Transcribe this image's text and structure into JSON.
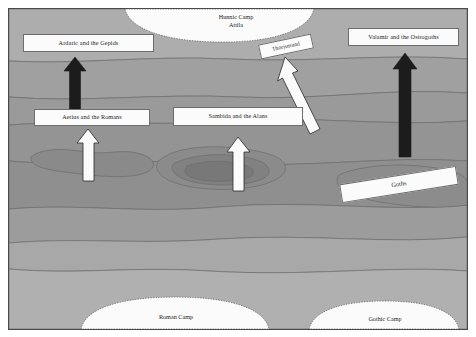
{
  "map": {
    "title_present": false,
    "background_color": "#a9a9a9",
    "border_color": "#4a4a4a",
    "label_fill": "#fbfbfb",
    "label_border": "#6d6d6d",
    "dark_arrow_color": "#1c1c1c",
    "light_arrow_color": "#fbfbfb"
  },
  "camps": [
    {
      "id": "hunnic-camp",
      "name": "Hunnic Camp",
      "leader": "Attila"
    },
    {
      "id": "roman-camp",
      "name": "Roman Camp",
      "leader": ""
    },
    {
      "id": "gothic-camp",
      "name": "Gothic Camp",
      "leader": ""
    }
  ],
  "unit_labels": [
    {
      "id": "ardaric-gepids",
      "text": "Ardaric and the Gepids"
    },
    {
      "id": "valamir-ostrogoths",
      "text": "Valamir and the Ostrogoths"
    },
    {
      "id": "thorismund",
      "text": "Thorismund"
    },
    {
      "id": "aetius-romans",
      "text": "Aetius and the Romans"
    },
    {
      "id": "sambida-alans",
      "text": "Sambida and the Alans"
    },
    {
      "id": "goths",
      "text": "Goths"
    }
  ],
  "arrows": [
    {
      "id": "ardaric-advance",
      "style": "dark",
      "direction": "north"
    },
    {
      "id": "valamir-advance",
      "style": "dark",
      "direction": "north"
    },
    {
      "id": "thorismund-advance",
      "style": "light",
      "direction": "north-northwest"
    },
    {
      "id": "aetius-advance",
      "style": "light",
      "direction": "north"
    },
    {
      "id": "sambida-advance",
      "style": "light",
      "direction": "north"
    }
  ]
}
